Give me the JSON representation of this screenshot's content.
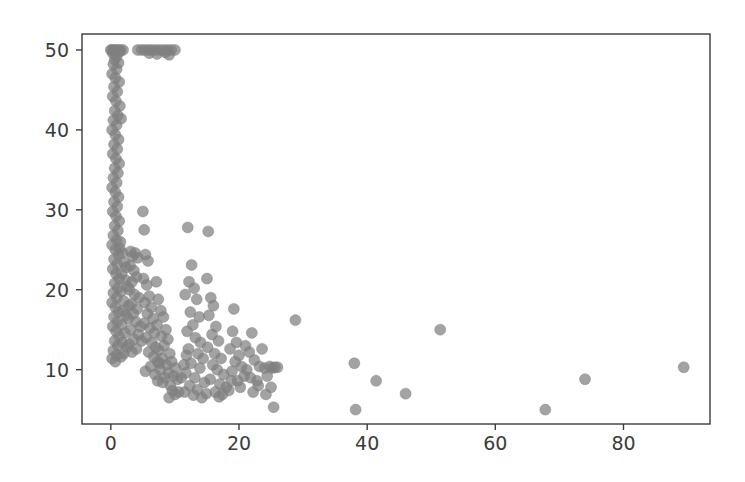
{
  "figure": {
    "background_color": "#ffffff",
    "axes_background_color": "#ffffff",
    "spine_color": "#3b3b3b",
    "tick_color": "#3b3b3b",
    "tick_label_color": "#3b3b3b",
    "axes_rect_px": {
      "left": 82,
      "top": 34,
      "right": 710,
      "bottom": 424
    }
  },
  "chart_data": {
    "type": "scatter",
    "title": "",
    "xlabel": "",
    "ylabel": "",
    "xlim": [
      -4.5,
      93.5
    ],
    "ylim": [
      3.2,
      52.0
    ],
    "xticks": [
      0,
      20,
      40,
      60,
      80
    ],
    "yticks": [
      10,
      20,
      30,
      40,
      50
    ],
    "xtick_labels": [
      "0",
      "20",
      "40",
      "60",
      "80"
    ],
    "ytick_labels": [
      "10",
      "20",
      "30",
      "40",
      "50"
    ],
    "grid": false,
    "legend": null,
    "marker": {
      "shape": "circle",
      "color": "#7f7f7f",
      "edge_color": "#7f7f7f",
      "size_px": 11,
      "alpha": 0.72
    },
    "series": [
      {
        "name": "observations",
        "points": [
          [
            0.0,
            50.0
          ],
          [
            0.2,
            50.0
          ],
          [
            0.5,
            50.0
          ],
          [
            0.8,
            50.0
          ],
          [
            1.1,
            50.0
          ],
          [
            1.5,
            50.0
          ],
          [
            1.9,
            50.0
          ],
          [
            0.3,
            49.6
          ],
          [
            0.9,
            49.2
          ],
          [
            1.4,
            49.8
          ],
          [
            0.6,
            48.8
          ],
          [
            1.2,
            48.4
          ],
          [
            4.2,
            50.0
          ],
          [
            4.8,
            50.0
          ],
          [
            5.3,
            50.0
          ],
          [
            5.9,
            50.0
          ],
          [
            6.4,
            50.0
          ],
          [
            7.0,
            50.0
          ],
          [
            7.6,
            50.0
          ],
          [
            8.2,
            50.0
          ],
          [
            8.8,
            50.0
          ],
          [
            9.4,
            50.0
          ],
          [
            10.0,
            50.0
          ],
          [
            6.0,
            49.6
          ],
          [
            7.2,
            49.5
          ],
          [
            8.5,
            49.7
          ],
          [
            9.1,
            49.4
          ],
          [
            0.4,
            48.2
          ],
          [
            0.9,
            47.6
          ],
          [
            0.2,
            47.0
          ],
          [
            0.7,
            46.5
          ],
          [
            1.3,
            46.0
          ],
          [
            0.5,
            45.4
          ],
          [
            1.0,
            44.8
          ],
          [
            0.3,
            44.2
          ],
          [
            0.8,
            43.6
          ],
          [
            1.4,
            43.0
          ],
          [
            0.6,
            42.4
          ],
          [
            1.1,
            41.8
          ],
          [
            0.4,
            41.2
          ],
          [
            1.6,
            41.4
          ],
          [
            0.9,
            40.6
          ],
          [
            0.2,
            40.0
          ],
          [
            0.7,
            39.4
          ],
          [
            1.2,
            38.8
          ],
          [
            0.5,
            38.2
          ],
          [
            1.0,
            37.6
          ],
          [
            0.3,
            37.0
          ],
          [
            0.8,
            36.4
          ],
          [
            1.3,
            35.8
          ],
          [
            0.6,
            35.2
          ],
          [
            1.1,
            34.6
          ],
          [
            0.4,
            34.0
          ],
          [
            0.9,
            33.4
          ],
          [
            0.2,
            32.8
          ],
          [
            0.7,
            32.2
          ],
          [
            1.2,
            31.6
          ],
          [
            0.5,
            31.0
          ],
          [
            1.0,
            30.4
          ],
          [
            0.3,
            29.8
          ],
          [
            0.8,
            29.2
          ],
          [
            1.3,
            28.6
          ],
          [
            0.6,
            28.0
          ],
          [
            1.1,
            27.4
          ],
          [
            0.4,
            26.8
          ],
          [
            0.9,
            26.2
          ],
          [
            0.2,
            25.6
          ],
          [
            0.7,
            25.0
          ],
          [
            1.4,
            25.2
          ],
          [
            1.2,
            24.4
          ],
          [
            0.5,
            23.8
          ],
          [
            1.0,
            23.2
          ],
          [
            0.3,
            22.6
          ],
          [
            0.8,
            22.0
          ],
          [
            1.3,
            21.4
          ],
          [
            0.6,
            20.8
          ],
          [
            1.1,
            20.2
          ],
          [
            0.4,
            19.6
          ],
          [
            0.9,
            19.0
          ],
          [
            0.2,
            18.4
          ],
          [
            0.7,
            17.8
          ],
          [
            1.2,
            17.2
          ],
          [
            0.5,
            16.6
          ],
          [
            1.0,
            16.0
          ],
          [
            0.3,
            15.4
          ],
          [
            0.8,
            14.8
          ],
          [
            1.3,
            14.2
          ],
          [
            0.6,
            13.6
          ],
          [
            1.1,
            13.0
          ],
          [
            0.4,
            12.4
          ],
          [
            0.9,
            11.8
          ],
          [
            0.2,
            11.4
          ],
          [
            0.7,
            11.0
          ],
          [
            1.5,
            26.0
          ],
          [
            1.8,
            24.6
          ],
          [
            2.1,
            23.4
          ],
          [
            1.7,
            22.0
          ],
          [
            2.3,
            21.2
          ],
          [
            1.6,
            19.8
          ],
          [
            2.0,
            18.6
          ],
          [
            1.9,
            17.4
          ],
          [
            2.4,
            16.8
          ],
          [
            1.7,
            15.6
          ],
          [
            2.2,
            14.6
          ],
          [
            1.8,
            13.4
          ],
          [
            2.5,
            12.8
          ],
          [
            2.0,
            12.0
          ],
          [
            1.6,
            11.6
          ],
          [
            2.6,
            20.4
          ],
          [
            2.8,
            18.0
          ],
          [
            2.4,
            22.8
          ],
          [
            3.1,
            24.8
          ],
          [
            3.4,
            24.2
          ],
          [
            3.8,
            24.6
          ],
          [
            4.2,
            24.0
          ],
          [
            3.0,
            23.0
          ],
          [
            3.6,
            22.4
          ],
          [
            4.0,
            21.6
          ],
          [
            3.3,
            21.0
          ],
          [
            2.9,
            20.0
          ],
          [
            3.7,
            19.4
          ],
          [
            4.4,
            19.0
          ],
          [
            3.2,
            18.2
          ],
          [
            4.1,
            17.6
          ],
          [
            3.5,
            17.0
          ],
          [
            2.7,
            16.4
          ],
          [
            3.9,
            16.0
          ],
          [
            4.6,
            15.4
          ],
          [
            3.1,
            15.0
          ],
          [
            4.3,
            14.4
          ],
          [
            3.6,
            13.8
          ],
          [
            2.8,
            13.2
          ],
          [
            4.0,
            12.6
          ],
          [
            3.3,
            12.2
          ],
          [
            4.8,
            13.6
          ],
          [
            5.0,
            29.8
          ],
          [
            5.2,
            27.5
          ],
          [
            5.4,
            24.4
          ],
          [
            5.8,
            23.6
          ],
          [
            5.1,
            21.4
          ],
          [
            5.6,
            20.6
          ],
          [
            6.0,
            19.2
          ],
          [
            5.3,
            18.4
          ],
          [
            6.3,
            17.8
          ],
          [
            5.7,
            17.0
          ],
          [
            6.6,
            16.4
          ],
          [
            5.2,
            15.8
          ],
          [
            6.1,
            15.2
          ],
          [
            6.8,
            14.6
          ],
          [
            5.5,
            14.0
          ],
          [
            6.4,
            13.4
          ],
          [
            7.0,
            12.8
          ],
          [
            5.9,
            12.2
          ],
          [
            6.7,
            11.6
          ],
          [
            7.3,
            11.0
          ],
          [
            6.2,
            10.4
          ],
          [
            7.6,
            10.8
          ],
          [
            5.4,
            9.8
          ],
          [
            6.9,
            9.4
          ],
          [
            7.1,
            21.0
          ],
          [
            7.4,
            18.8
          ],
          [
            7.8,
            17.4
          ],
          [
            8.2,
            16.6
          ],
          [
            7.2,
            15.6
          ],
          [
            8.6,
            15.0
          ],
          [
            7.9,
            14.2
          ],
          [
            8.9,
            13.8
          ],
          [
            8.3,
            13.0
          ],
          [
            7.5,
            12.4
          ],
          [
            9.2,
            12.0
          ],
          [
            8.0,
            11.4
          ],
          [
            9.5,
            11.0
          ],
          [
            8.7,
            10.6
          ],
          [
            7.7,
            10.0
          ],
          [
            9.0,
            9.6
          ],
          [
            8.4,
            9.0
          ],
          [
            9.8,
            9.2
          ],
          [
            8.1,
            8.4
          ],
          [
            9.3,
            8.0
          ],
          [
            7.3,
            8.6
          ],
          [
            10.1,
            10.2
          ],
          [
            10.4,
            8.8
          ],
          [
            9.6,
            7.4
          ],
          [
            10.0,
            6.9
          ],
          [
            9.1,
            6.5
          ],
          [
            10.6,
            7.2
          ],
          [
            11.0,
            9.0
          ],
          [
            11.4,
            10.6
          ],
          [
            11.8,
            11.8
          ],
          [
            12.0,
            27.8
          ],
          [
            12.6,
            23.1
          ],
          [
            12.2,
            21.0
          ],
          [
            13.0,
            20.2
          ],
          [
            11.6,
            19.4
          ],
          [
            13.4,
            18.8
          ],
          [
            12.4,
            17.2
          ],
          [
            13.8,
            16.6
          ],
          [
            12.8,
            15.6
          ],
          [
            11.9,
            14.8
          ],
          [
            13.2,
            14.0
          ],
          [
            14.0,
            13.4
          ],
          [
            12.1,
            12.6
          ],
          [
            13.6,
            12.0
          ],
          [
            14.4,
            11.4
          ],
          [
            12.5,
            10.8
          ],
          [
            13.9,
            10.2
          ],
          [
            11.7,
            9.6
          ],
          [
            13.1,
            9.0
          ],
          [
            14.6,
            8.4
          ],
          [
            12.3,
            8.0
          ],
          [
            13.5,
            7.5
          ],
          [
            14.9,
            7.0
          ],
          [
            12.9,
            6.8
          ],
          [
            14.2,
            6.5
          ],
          [
            11.5,
            7.2
          ],
          [
            15.2,
            27.3
          ],
          [
            15.0,
            21.4
          ],
          [
            15.6,
            19.0
          ],
          [
            16.0,
            18.0
          ],
          [
            15.3,
            16.8
          ],
          [
            16.4,
            15.4
          ],
          [
            15.8,
            14.4
          ],
          [
            16.8,
            13.6
          ],
          [
            15.1,
            12.8
          ],
          [
            16.2,
            12.0
          ],
          [
            17.2,
            11.4
          ],
          [
            15.9,
            10.6
          ],
          [
            16.6,
            10.0
          ],
          [
            17.6,
            9.4
          ],
          [
            15.5,
            8.8
          ],
          [
            17.0,
            8.2
          ],
          [
            18.0,
            7.8
          ],
          [
            16.3,
            7.2
          ],
          [
            17.4,
            6.9
          ],
          [
            18.4,
            7.4
          ],
          [
            16.9,
            6.6
          ],
          [
            18.8,
            8.6
          ],
          [
            19.2,
            17.6
          ],
          [
            19.0,
            14.8
          ],
          [
            19.6,
            13.4
          ],
          [
            18.6,
            12.6
          ],
          [
            20.0,
            11.8
          ],
          [
            19.4,
            11.0
          ],
          [
            20.4,
            10.4
          ],
          [
            18.9,
            9.8
          ],
          [
            20.8,
            9.2
          ],
          [
            19.8,
            8.6
          ],
          [
            21.2,
            10.0
          ],
          [
            20.2,
            7.8
          ],
          [
            21.6,
            12.2
          ],
          [
            22.0,
            14.6
          ],
          [
            21.0,
            13.0
          ],
          [
            22.4,
            11.2
          ],
          [
            21.8,
            9.0
          ],
          [
            22.8,
            8.6
          ],
          [
            22.2,
            7.2
          ],
          [
            23.2,
            10.4
          ],
          [
            23.6,
            12.6
          ],
          [
            24.0,
            10.2
          ],
          [
            24.4,
            9.2
          ],
          [
            23.0,
            8.0
          ],
          [
            24.8,
            10.4
          ],
          [
            25.2,
            10.2
          ],
          [
            25.6,
            10.3
          ],
          [
            25.0,
            7.8
          ],
          [
            25.4,
            5.3
          ],
          [
            24.2,
            6.9
          ],
          [
            26.0,
            10.3
          ],
          [
            28.8,
            16.2
          ],
          [
            38.0,
            10.8
          ],
          [
            41.4,
            8.6
          ],
          [
            46.0,
            7.0
          ],
          [
            38.2,
            5.0
          ],
          [
            51.4,
            15.0
          ],
          [
            67.8,
            5.0
          ],
          [
            74.0,
            8.8
          ],
          [
            89.4,
            10.3
          ]
        ]
      }
    ]
  }
}
